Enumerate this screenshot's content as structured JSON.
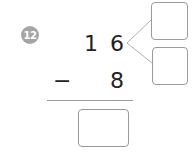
{
  "problem": {
    "number": "12",
    "top_tens": "1",
    "top_ones": "6",
    "operator": "−",
    "subtrahend": "8",
    "decompose_boxes": [
      "",
      ""
    ],
    "answer_box": ""
  }
}
